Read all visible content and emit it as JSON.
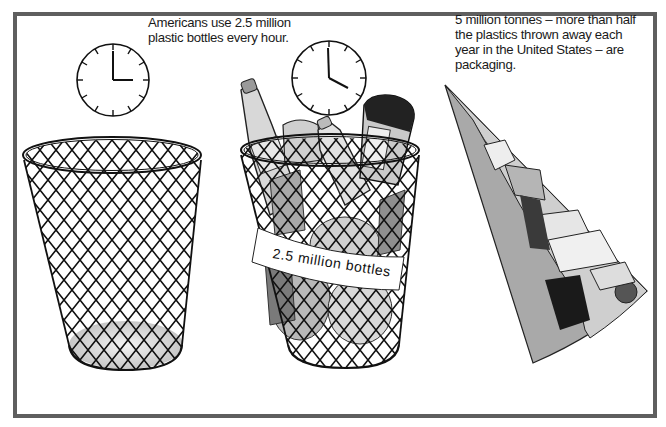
{
  "captions": {
    "bottles_per_hour": {
      "line1": "Americans use 2.5 million",
      "line2": "plastic bottles every hour."
    },
    "packaging_share": {
      "line1": "5 million tonnes – more than half",
      "line2": "the plastics thrown away each",
      "line3": "year in the United States – are",
      "line4": "packaging."
    }
  },
  "panels": [
    {
      "name": "empty-basket",
      "clock_time": "3:00",
      "contents": "empty"
    },
    {
      "name": "full-basket",
      "clock_time": "4:00",
      "contents": "plastic bottles",
      "label": "2.5 million bottles"
    },
    {
      "name": "pie-wedge",
      "depicts": "share of plastics waste that is packaging",
      "segments": [
        "plain gray portion",
        "packaging illustration portion"
      ]
    }
  ],
  "basket_label": "2.5 million bottles",
  "colors": {
    "frame": "#5f5f5f",
    "ink": "#111111",
    "wedge_gray": "#a9a9a9",
    "background": "#ffffff"
  }
}
